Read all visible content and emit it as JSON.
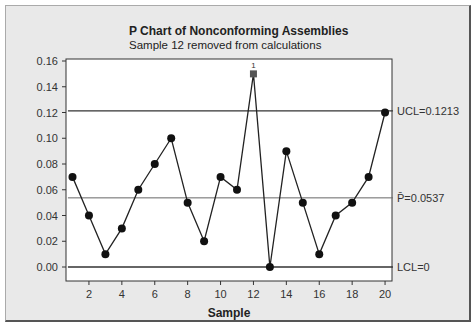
{
  "chart_data": {
    "type": "line",
    "title": "P Chart of Nonconforming Assemblies",
    "subtitle": "Sample 12 removed from calculations",
    "xlabel": "Sample",
    "ylabel": "",
    "x": [
      1,
      2,
      3,
      4,
      5,
      6,
      7,
      8,
      9,
      10,
      11,
      12,
      13,
      14,
      15,
      16,
      17,
      18,
      19,
      20
    ],
    "series": [
      {
        "name": "Proportion",
        "values": [
          0.07,
          0.04,
          0.01,
          0.03,
          0.06,
          0.08,
          0.1,
          0.05,
          0.02,
          0.07,
          0.06,
          0.15,
          0.0,
          0.09,
          0.05,
          0.01,
          0.04,
          0.05,
          0.07,
          0.12
        ]
      }
    ],
    "excluded_points": [
      12
    ],
    "point_annotations": [
      {
        "x": 12,
        "label": "1"
      }
    ],
    "ylim": [
      0,
      0.16
    ],
    "xlim": [
      0.6,
      20.6
    ],
    "yticks": [
      "0.00",
      "0.02",
      "0.04",
      "0.06",
      "0.08",
      "0.10",
      "0.12",
      "0.14",
      "0.16"
    ],
    "xticks": [
      "2",
      "4",
      "6",
      "8",
      "10",
      "12",
      "14",
      "16",
      "18",
      "20"
    ],
    "reference_lines": [
      {
        "name": "UCL",
        "value": 0.1213,
        "label": "UCL=0.1213"
      },
      {
        "name": "P-bar",
        "value": 0.0537,
        "label": "P̄=0.0537"
      },
      {
        "name": "LCL",
        "value": 0,
        "label": "LCL=0"
      }
    ],
    "grid": false,
    "legend": "none"
  }
}
